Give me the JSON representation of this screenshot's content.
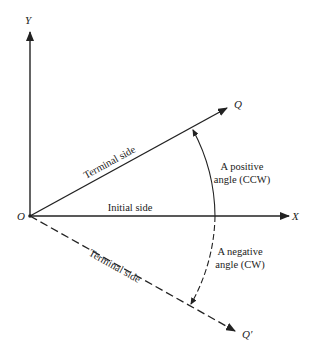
{
  "diagram": {
    "axes": {
      "y_label": "Y",
      "x_label": "X",
      "origin_label": "O"
    },
    "points": {
      "q_label": "Q",
      "q_prime_label": "Q′"
    },
    "labels": {
      "terminal_side_positive": "Terminal side",
      "terminal_side_negative": "Terminal side",
      "initial_side": "Initial side",
      "positive_angle_line1": "A positive",
      "positive_angle_line2": "angle (CCW)",
      "negative_angle_line1": "A negative",
      "negative_angle_line2": "angle (CW)"
    },
    "colors": {
      "stroke": "#222222",
      "background": "#ffffff"
    }
  }
}
